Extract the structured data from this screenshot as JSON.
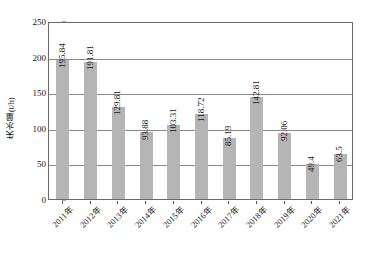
{
  "chart_data": {
    "type": "bar",
    "title": "",
    "xlabel": "",
    "ylabel": "失水量(t/h)",
    "ylim": [
      0,
      250
    ],
    "ytick_values": [
      0,
      50,
      100,
      150,
      200,
      250
    ],
    "ytick_labels": [
      "0",
      "50",
      "100",
      "150",
      "200",
      "250"
    ],
    "grid": "horizontal",
    "legend": "none",
    "bar_color": "#b5b5b5",
    "axis_color": "#6b6b6b",
    "gridline_color": "#8a8a8a",
    "categories": [
      "2011年",
      "2012年",
      "2013年",
      "2014年",
      "2015年",
      "2016年",
      "2017年",
      "2018年",
      "2019年",
      "2020年",
      "2021年"
    ],
    "values": [
      195.84,
      191.81,
      129.81,
      93.88,
      103.31,
      118.72,
      85.19,
      142.81,
      92.06,
      49.4,
      63.5
    ],
    "value_labels": [
      "195.84",
      "191.81",
      "129.81",
      "93.88",
      "103.31",
      "118.72",
      "85.19",
      "142.81",
      "92.06",
      "49.4",
      "63.5"
    ]
  }
}
